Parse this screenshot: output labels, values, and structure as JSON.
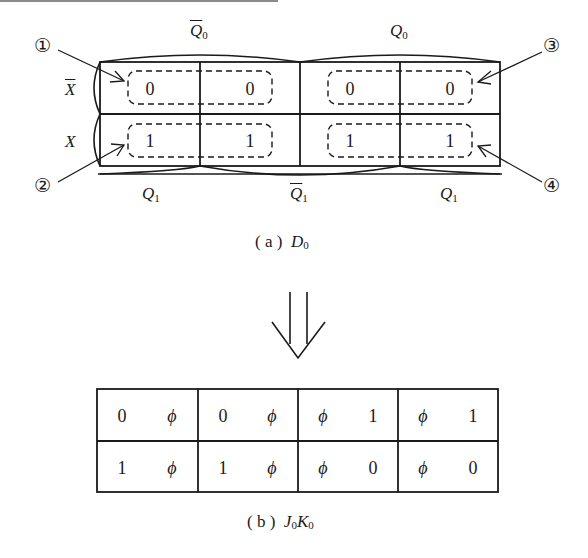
{
  "figure_a": {
    "caption_prefix": "( a )",
    "caption_var": "D",
    "caption_sub": "0",
    "col_headers_top": [
      {
        "var": "Q",
        "sub": "0",
        "bar": true
      },
      {
        "var": "Q",
        "sub": "0",
        "bar": false
      }
    ],
    "col_headers_bottom": [
      {
        "var": "Q",
        "sub": "1",
        "bar": false
      },
      {
        "var": "Q",
        "sub": "1",
        "bar": true
      },
      {
        "var": "Q",
        "sub": "1",
        "bar": false
      }
    ],
    "row_headers": [
      {
        "var": "X",
        "bar": true
      },
      {
        "var": "X",
        "bar": false
      }
    ],
    "cells": [
      [
        "0",
        "0",
        "0",
        "0"
      ],
      [
        "1",
        "1",
        "1",
        "1"
      ]
    ],
    "markers": [
      "①",
      "②",
      "③",
      "④"
    ]
  },
  "arrow": {
    "symbol": "double-down-arrow"
  },
  "figure_b": {
    "caption_prefix": "( b )",
    "caption_var1": "J",
    "caption_sub1": "0",
    "caption_var2": "K",
    "caption_sub2": "0",
    "cells": [
      [
        [
          "0",
          "ϕ"
        ],
        [
          "0",
          "ϕ"
        ],
        [
          "ϕ",
          "1"
        ],
        [
          "ϕ",
          "1"
        ]
      ],
      [
        [
          "1",
          "ϕ"
        ],
        [
          "1",
          "ϕ"
        ],
        [
          "ϕ",
          "0"
        ],
        [
          "ϕ",
          "0"
        ]
      ]
    ]
  }
}
